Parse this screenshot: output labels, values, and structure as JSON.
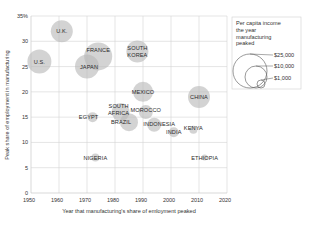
{
  "chart_data": {
    "type": "scatter",
    "subtype": "bubble",
    "title": "",
    "xlabel": "Year that manufacturing's share of emloyment peaked",
    "ylabel": "Peak share of employment in manufacturing",
    "xlim": [
      1950,
      2020
    ],
    "ylim": [
      0,
      35
    ],
    "x_ticks": [
      "1950",
      "1960",
      "1970",
      "1980",
      "1990",
      "2000",
      "2010",
      "2020"
    ],
    "y_ticks": [
      "0",
      "5",
      "10",
      "15",
      "20",
      "25",
      "30",
      "35%"
    ],
    "grid": true,
    "legend": {
      "title_lines": [
        "Per capita income",
        "the year",
        "manufacturing",
        "peaked"
      ],
      "entries": [
        "$25,000",
        "$10,000",
        "$1,000"
      ],
      "position": "top-right"
    },
    "points": [
      {
        "label": "U.S.",
        "x": 1953,
        "y": 26,
        "size": 12,
        "label_dx": 0,
        "label_dy": 0
      },
      {
        "label": "U.K.",
        "x": 1961,
        "y": 32,
        "size": 11,
        "label_dx": 0,
        "label_dy": 0
      },
      {
        "label": "JAPAN",
        "x": 1970,
        "y": 25,
        "size": 12,
        "label_dx": 2,
        "label_dy": 0
      },
      {
        "label": "FRANCE",
        "x": 1974,
        "y": 27,
        "size": 14,
        "label_dx": 0,
        "label_dy": -6
      },
      {
        "label": "SOUTH KOREA",
        "x": 1988,
        "y": 28,
        "size": 11,
        "label_dx": 0,
        "label_dy": 0
      },
      {
        "label": "MEXICO",
        "x": 1990,
        "y": 20,
        "size": 10,
        "label_dx": 0,
        "label_dy": 0
      },
      {
        "label": "CHINA",
        "x": 2010,
        "y": 19,
        "size": 11,
        "label_dx": 0,
        "label_dy": 0
      },
      {
        "label": "SOUTH AFRICA",
        "x": 1982,
        "y": 16,
        "size": 9,
        "label_dx": -2,
        "label_dy": -3
      },
      {
        "label": "EGYPT",
        "x": 1972,
        "y": 15,
        "size": 5,
        "label_dx": -4,
        "label_dy": 0
      },
      {
        "label": "BRAZIL",
        "x": 1985,
        "y": 14,
        "size": 9,
        "label_dx": -8,
        "label_dy": 0
      },
      {
        "label": "MOROCCO",
        "x": 1991,
        "y": 16,
        "size": 7,
        "label_dx": 0,
        "label_dy": -2
      },
      {
        "label": "INDONESIA",
        "x": 1994,
        "y": 13.5,
        "size": 7,
        "label_dx": 5,
        "label_dy": -1
      },
      {
        "label": "INDIA",
        "x": 2001,
        "y": 12,
        "size": 5,
        "label_dx": 0,
        "label_dy": 0
      },
      {
        "label": "KENYA",
        "x": 2008,
        "y": 12.5,
        "size": 4,
        "label_dx": 0,
        "label_dy": -2
      },
      {
        "label": "NIGERIA",
        "x": 1973,
        "y": 7,
        "size": 4,
        "label_dx": 0,
        "label_dy": 0
      },
      {
        "label": "ETHIOPIA",
        "x": 2012,
        "y": 7,
        "size": 3,
        "label_dx": 0,
        "label_dy": 0
      }
    ]
  },
  "colors": {
    "bubble": "#b8b8b8",
    "grid": "#d4d4d4",
    "axis": "#bfbfbf",
    "text": "#333333",
    "legend_border": "#d0d0d0",
    "legend_circle": "#555555"
  }
}
